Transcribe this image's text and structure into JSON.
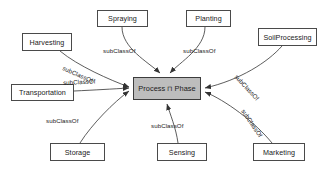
{
  "diagram": {
    "edge_label": "subClassOf",
    "center": {
      "label": "Process ⊓ Phase",
      "fill": "#bdbdbd",
      "stroke": "#3c3c3c"
    },
    "nodes": [
      {
        "id": "harvesting",
        "label": "Harvesting"
      },
      {
        "id": "spraying",
        "label": "Spraying"
      },
      {
        "id": "planting",
        "label": "Planting"
      },
      {
        "id": "soilprocessing",
        "label": "SoilProcessing"
      },
      {
        "id": "transportation",
        "label": "Transportation"
      },
      {
        "id": "storage",
        "label": "Storage"
      },
      {
        "id": "sensing",
        "label": "Sensing"
      },
      {
        "id": "marketing",
        "label": "Marketing"
      }
    ],
    "edges": [
      {
        "from": "harvesting",
        "to": "center",
        "label": "subClassOf"
      },
      {
        "from": "spraying",
        "to": "center",
        "label": "subClassOf"
      },
      {
        "from": "planting",
        "to": "center",
        "label": "subClassOf"
      },
      {
        "from": "soilprocessing",
        "to": "center",
        "label": "subClassOf"
      },
      {
        "from": "transportation",
        "to": "center",
        "label": "subClassOf"
      },
      {
        "from": "storage",
        "to": "center",
        "label": "subClassOf"
      },
      {
        "from": "sensing",
        "to": "center",
        "label": "subClassOf"
      },
      {
        "from": "marketing",
        "to": "center",
        "label": "subClassOf"
      }
    ],
    "colors": {
      "node_stroke": "#4a4a4a",
      "node_fill": "#ffffff",
      "edge_stroke": "#333333",
      "text": "#1a1a1a",
      "background": "#ffffff"
    }
  }
}
